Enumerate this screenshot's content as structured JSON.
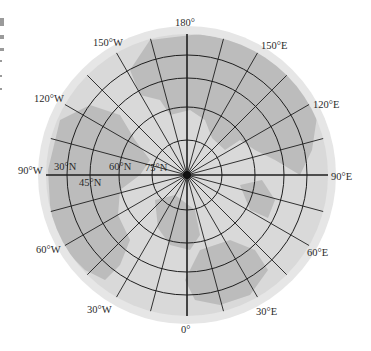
{
  "map": {
    "projection": "north-polar azimuthal",
    "center": {
      "x": 187,
      "y": 175
    },
    "outer_disk_radius": 149,
    "grid_radius": 141,
    "colors": {
      "background": "#ffffff",
      "outer_rim": "#e6e6e6",
      "ocean": "#d9d9d9",
      "land": "#bcbcbc",
      "grid": "#1e1e1e",
      "label": "#2a2a2a"
    },
    "parallels": [
      {
        "lat": "30°N",
        "radius": 120
      },
      {
        "lat": "45°N",
        "radius": 97
      },
      {
        "lat": "60°N",
        "radius": 68
      },
      {
        "lat": "75°N",
        "radius": 35
      }
    ],
    "meridian_step_deg": 15,
    "longitude_labels": [
      {
        "text": "180°",
        "x": 175,
        "y": 18
      },
      {
        "text": "150°E",
        "x": 261,
        "y": 41
      },
      {
        "text": "120°E",
        "x": 313,
        "y": 100
      },
      {
        "text": "90°E",
        "x": 331,
        "y": 172
      },
      {
        "text": "60°E",
        "x": 307,
        "y": 248
      },
      {
        "text": "30°E",
        "x": 256,
        "y": 307
      },
      {
        "text": "0°",
        "x": 181,
        "y": 325
      },
      {
        "text": "30°W",
        "x": 87,
        "y": 305
      },
      {
        "text": "60°W",
        "x": 36,
        "y": 245
      },
      {
        "text": "90°W",
        "x": 18,
        "y": 166
      },
      {
        "text": "120°W",
        "x": 34,
        "y": 94
      },
      {
        "text": "150°W",
        "x": 93,
        "y": 38
      }
    ],
    "latitude_labels": [
      {
        "text": "30°N",
        "x": 54,
        "y": 162
      },
      {
        "text": "45°N",
        "x": 79,
        "y": 178
      },
      {
        "text": "60°N",
        "x": 109,
        "y": 162
      },
      {
        "text": "75°N",
        "x": 145,
        "y": 163
      }
    ]
  }
}
